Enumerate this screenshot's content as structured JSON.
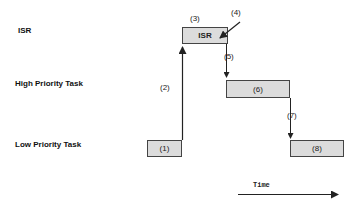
{
  "rows": {
    "isr": "ISR",
    "high": "High Priority Task",
    "low": "Low Priority Task"
  },
  "boxes": {
    "isr": "ISR",
    "b1": "(1)",
    "b6": "(6)",
    "b8": "(8)"
  },
  "notes": {
    "n2": "(2)",
    "n3": "(3)",
    "n4": "(4)",
    "n5": "(5)",
    "n7": "(7)"
  },
  "axis": {
    "time_label": "Time"
  },
  "colors": {
    "box_fill": "#dcdcdc",
    "box_border": "#444444",
    "line": "#222222"
  }
}
